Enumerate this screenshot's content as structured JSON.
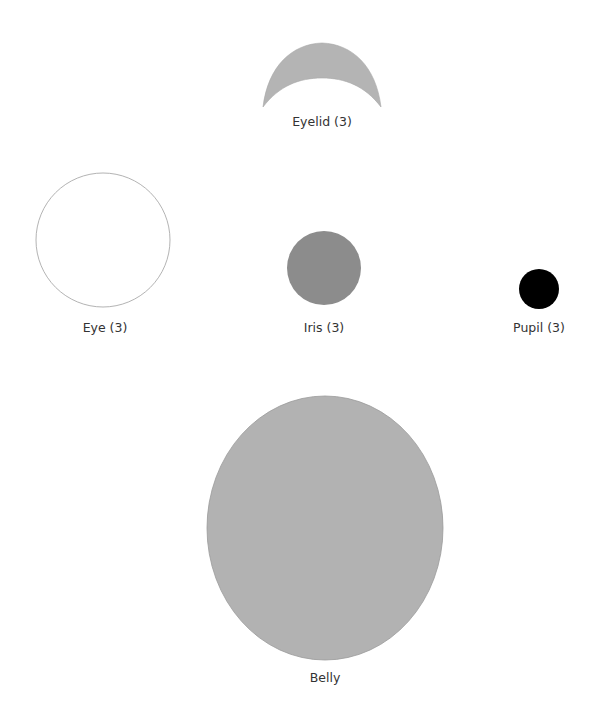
{
  "parts": {
    "eyelid": {
      "label": "Eyelid (3)",
      "fill": "#b4b4b4"
    },
    "eye": {
      "label": "Eye (3)",
      "fill": "#ffffff",
      "stroke": "#a0a0a0"
    },
    "iris": {
      "label": "Iris (3)",
      "fill": "#8c8c8c"
    },
    "pupil": {
      "label": "Pupil (3)",
      "fill": "#000000"
    },
    "belly": {
      "label": "Belly",
      "fill": "#b2b2b2",
      "stroke": "#9a9a9a"
    }
  }
}
